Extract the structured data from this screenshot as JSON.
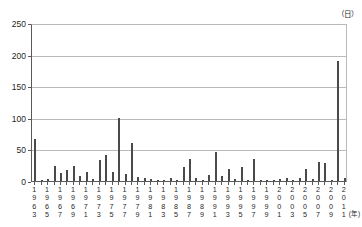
{
  "chart_data": {
    "type": "bar",
    "title": "",
    "xlabel": "年",
    "ylabel": "日",
    "unit_label": "（日）",
    "year_suffix": "(年)",
    "ylim": [
      0,
      250
    ],
    "ytick_values": [
      0,
      50,
      100,
      150,
      200,
      250
    ],
    "ytick_labels": [
      "0",
      "50",
      "100",
      "150",
      "200",
      "250"
    ],
    "grid": true,
    "legend": "none",
    "xlim": [
      1963,
      2011
    ],
    "xtick_step": 2,
    "xtick_labels": [
      "1963",
      "1965",
      "1967",
      "1969",
      "1971",
      "1973",
      "1975",
      "1977",
      "1979",
      "1981",
      "1983",
      "1985",
      "1987",
      "1989",
      "1991",
      "1993",
      "1995",
      "1997",
      "1999",
      "2001",
      "2003",
      "2005",
      "2007",
      "2009",
      "2011"
    ],
    "categories": [
      1963,
      1964,
      1965,
      1966,
      1967,
      1968,
      1969,
      1970,
      1971,
      1972,
      1973,
      1974,
      1975,
      1976,
      1977,
      1978,
      1979,
      1980,
      1981,
      1982,
      1983,
      1984,
      1985,
      1986,
      1987,
      1988,
      1989,
      1990,
      1991,
      1992,
      1993,
      1994,
      1995,
      1996,
      1997,
      1998,
      1999,
      2000,
      2001,
      2002,
      2003,
      2004,
      2005,
      2006,
      2007,
      2008,
      2009,
      2010,
      2011
    ],
    "values": [
      66,
      2,
      3,
      24,
      12,
      18,
      23,
      8,
      14,
      3,
      33,
      41,
      15,
      100,
      11,
      60,
      7,
      4,
      3,
      2,
      2,
      4,
      1,
      22,
      35,
      5,
      2,
      9,
      46,
      8,
      19,
      3,
      22,
      2,
      35,
      1,
      2,
      2,
      3,
      4,
      2,
      5,
      19,
      3,
      30,
      28,
      2,
      190,
      4
    ],
    "bar_color": "#4a4a4a",
    "grid_color": "#b9b9b9",
    "axis_color": "#5a5a5a"
  }
}
